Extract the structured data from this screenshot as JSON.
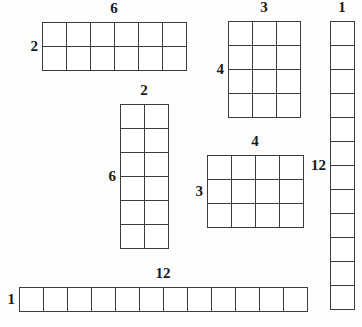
{
  "page": {
    "background_color": "#fdfdfd",
    "line_color": "#3c3c3c",
    "cell_color": "#ffffff",
    "cell_size_px": 24
  },
  "arrays": [
    {
      "name": "array-2-by-6",
      "rows": 2,
      "cols": 6,
      "top_label": "6",
      "left_label": "2",
      "x": 42,
      "y": 22,
      "top_label_x": 114,
      "top_label_y": 16,
      "left_label_x": 38,
      "left_label_y": 46
    },
    {
      "name": "array-4-by-3",
      "rows": 4,
      "cols": 3,
      "top_label": "3",
      "left_label": "4",
      "x": 228,
      "y": 21,
      "top_label_x": 264,
      "top_label_y": 15,
      "left_label_x": 224,
      "left_label_y": 69
    },
    {
      "name": "array-12-by-1",
      "rows": 12,
      "cols": 1,
      "top_label": "1",
      "left_label": "12",
      "x": 330,
      "y": 21,
      "top_label_x": 342,
      "top_label_y": 15,
      "left_label_x": 326,
      "left_label_y": 165
    },
    {
      "name": "array-6-by-2",
      "rows": 6,
      "cols": 2,
      "top_label": "2",
      "left_label": "6",
      "x": 120,
      "y": 104,
      "top_label_x": 144,
      "top_label_y": 98,
      "left_label_x": 116,
      "left_label_y": 176
    },
    {
      "name": "array-3-by-4",
      "rows": 3,
      "cols": 4,
      "top_label": "4",
      "left_label": "3",
      "x": 207,
      "y": 155,
      "top_label_x": 255,
      "top_label_y": 149,
      "left_label_x": 203,
      "left_label_y": 191
    },
    {
      "name": "array-1-by-12",
      "rows": 1,
      "cols": 12,
      "top_label": "12",
      "left_label": "1",
      "x": 19,
      "y": 287,
      "top_label_x": 163,
      "top_label_y": 281,
      "left_label_x": 15,
      "left_label_y": 299
    }
  ],
  "chart_data": {
    "type": "table",
    "xlabel": "columns",
    "ylabel": "rows",
    "categories": [
      "2x6",
      "4x3",
      "12x1",
      "6x2",
      "3x4",
      "1x12"
    ],
    "series": [
      {
        "name": "rows",
        "values": [
          2,
          4,
          12,
          6,
          3,
          1
        ]
      },
      {
        "name": "cols",
        "values": [
          6,
          3,
          1,
          2,
          4,
          12
        ]
      },
      {
        "name": "area",
        "values": [
          12,
          12,
          12,
          12,
          12,
          12
        ]
      }
    ],
    "annotations": [
      "6",
      "2",
      "3",
      "4",
      "1",
      "12",
      "2",
      "6",
      "4",
      "3",
      "12",
      "1"
    ]
  }
}
